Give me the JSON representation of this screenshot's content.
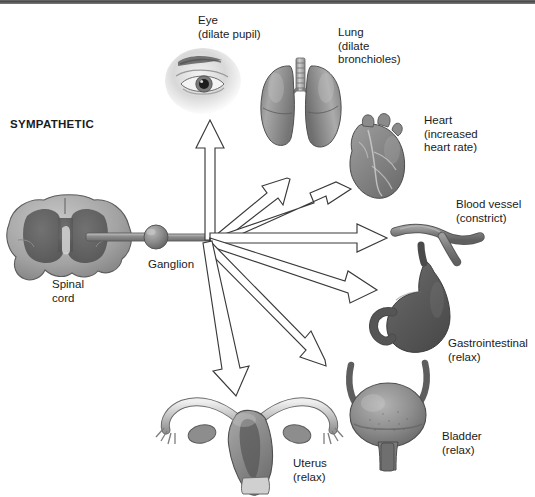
{
  "diagram": {
    "title_label": "SYMPATHETIC",
    "center_structures": [
      {
        "name": "spinal-cord",
        "label": "Spinal\ncord",
        "label_x": 52,
        "label_y": 278
      },
      {
        "name": "ganglion",
        "label": "Ganglion",
        "label_x": 148,
        "label_y": 258
      }
    ],
    "targets": [
      {
        "name": "eye",
        "label": "Eye\n(dilate pupil)",
        "label_x": 198,
        "label_y": 14,
        "effect": "dilate pupil",
        "arrow": {
          "from_x": 210,
          "from_y": 238,
          "to_x": 210,
          "to_y": 122,
          "tip": "up"
        }
      },
      {
        "name": "lung",
        "label": "Lung\n(dilate\nbronchioles)",
        "label_x": 338,
        "label_y": 26,
        "effect": "dilate bronchioles",
        "arrow": {
          "from_x": 210,
          "from_y": 238,
          "to_x": 303,
          "to_y": 148,
          "tip": "upright"
        }
      },
      {
        "name": "heart",
        "label": "Heart\n(increased\nheart rate)",
        "label_x": 424,
        "label_y": 114,
        "effect": "increased heart rate",
        "arrow": {
          "from_x": 210,
          "from_y": 238,
          "to_x": 350,
          "to_y": 184,
          "tip": "upright-shallow"
        }
      },
      {
        "name": "blood-vessel",
        "label": "Blood vessel\n(constrict)",
        "label_x": 456,
        "label_y": 198,
        "effect": "constrict",
        "arrow": {
          "from_x": 210,
          "from_y": 238,
          "to_x": 383,
          "to_y": 238,
          "tip": "right"
        }
      },
      {
        "name": "gastrointestinal",
        "label": "Gastrointestinal\n(relax)",
        "label_x": 448,
        "label_y": 337,
        "effect": "relax",
        "arrow": {
          "from_x": 210,
          "from_y": 238,
          "to_x": 372,
          "to_y": 297,
          "tip": "downright-shallow"
        }
      },
      {
        "name": "bladder",
        "label": "Bladder\n(relax)",
        "label_x": 442,
        "label_y": 430,
        "effect": "relax",
        "arrow": {
          "from_x": 210,
          "from_y": 238,
          "to_x": 339,
          "to_y": 366,
          "tip": "downright"
        }
      },
      {
        "name": "uterus",
        "label": "Uterus\n(relax)",
        "label_x": 293,
        "label_y": 457,
        "effect": "relax",
        "arrow": {
          "from_x": 210,
          "from_y": 238,
          "to_x": 239,
          "to_y": 395,
          "tip": "down"
        }
      }
    ],
    "colors": {
      "ink": "#1b1b1b",
      "arrow_stroke": "#3a3a3a",
      "arrow_fill": "#ffffff",
      "organ_mid": "#8f8f8f",
      "organ_dark": "#555555",
      "organ_light": "#d4d4d4",
      "top_rule": "#4a4a4a",
      "page_bg": "#ffffff"
    },
    "arrow_count": 7
  }
}
